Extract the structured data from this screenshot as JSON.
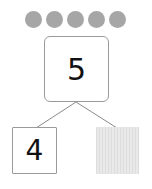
{
  "counters": {
    "count": 5,
    "color": "#a6a6a6"
  },
  "number_bond": {
    "whole": "5",
    "part_left": "4",
    "part_right": "",
    "part_right_state": "hidden"
  }
}
